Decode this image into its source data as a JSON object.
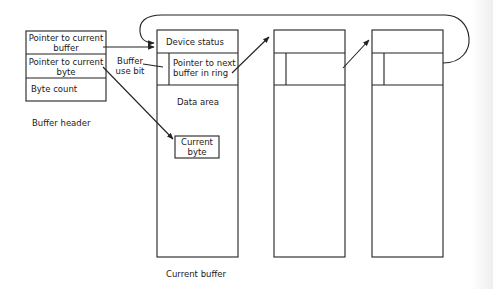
{
  "diagram": {
    "type": "buffer-ring-structure",
    "colors": {
      "line": "#222222",
      "background": "#ffffff"
    },
    "buffer_header": {
      "caption": "Buffer header",
      "fields": [
        {
          "line1": "Pointer to current",
          "line2": "buffer"
        },
        {
          "line1": "Pointer to current",
          "line2": "byte"
        },
        {
          "line1": "Byte count",
          "line2": ""
        }
      ]
    },
    "current_buffer": {
      "caption": "Current buffer",
      "device_status": "Device status",
      "next_pointer": {
        "line1": "Pointer to next",
        "line2": "buffer in ring"
      },
      "data_area": "Data area",
      "current_byte": {
        "line1": "Current",
        "line2": "byte"
      }
    },
    "annotations": {
      "buffer_use_bit": {
        "line1": "Buffer",
        "line2": "use bit"
      }
    },
    "ring_buffers_count": 3,
    "edges": [
      {
        "from": "Pointer to current buffer",
        "to": "Current buffer (Device status)"
      },
      {
        "from": "Pointer to current byte",
        "to": "Current byte"
      },
      {
        "from": "Buffer use bit label",
        "to": "Buffer use bit cell"
      },
      {
        "from": "Current buffer next pointer",
        "to": "Buffer 2"
      },
      {
        "from": "Buffer 2 next pointer",
        "to": "Buffer 3"
      },
      {
        "from": "Buffer 3 next pointer",
        "to": "Current buffer (ring wrap)"
      }
    ]
  }
}
